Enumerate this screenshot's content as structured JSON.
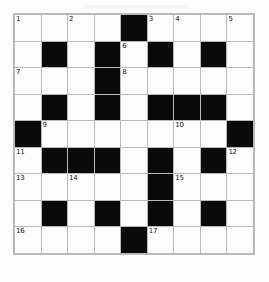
{
  "puzzle": {
    "title": "Crossword Grid",
    "rows": 9,
    "cols": 9,
    "colors": {
      "block": "#0a0a0a",
      "open": "#fcfcfc",
      "gridline": "#b9b9b9",
      "number": "#111111",
      "background": "#fdfdfd"
    },
    "grid": [
      [
        "open",
        "open",
        "open",
        "open",
        "block",
        "open",
        "open",
        "open",
        "open"
      ],
      [
        "open",
        "block",
        "open",
        "block",
        "open",
        "block",
        "open",
        "block",
        "open"
      ],
      [
        "open",
        "open",
        "open",
        "block",
        "open",
        "open",
        "open",
        "open",
        "open"
      ],
      [
        "open",
        "block",
        "open",
        "block",
        "open",
        "block",
        "block",
        "block",
        "open"
      ],
      [
        "block",
        "open",
        "open",
        "open",
        "open",
        "open",
        "open",
        "open",
        "block"
      ],
      [
        "open",
        "block",
        "block",
        "block",
        "open",
        "block",
        "open",
        "block",
        "open"
      ],
      [
        "open",
        "open",
        "open",
        "open",
        "open",
        "block",
        "open",
        "open",
        "open"
      ],
      [
        "open",
        "block",
        "open",
        "block",
        "open",
        "block",
        "open",
        "block",
        "open"
      ],
      [
        "open",
        "open",
        "open",
        "open",
        "block",
        "open",
        "open",
        "open",
        "open"
      ]
    ],
    "numbers": [
      {
        "row": 0,
        "col": 0,
        "label": "1"
      },
      {
        "row": 0,
        "col": 2,
        "label": "2"
      },
      {
        "row": 0,
        "col": 5,
        "label": "3"
      },
      {
        "row": 0,
        "col": 6,
        "label": "4"
      },
      {
        "row": 0,
        "col": 8,
        "label": "5"
      },
      {
        "row": 1,
        "col": 4,
        "label": "6"
      },
      {
        "row": 2,
        "col": 0,
        "label": "7"
      },
      {
        "row": 2,
        "col": 4,
        "label": "8"
      },
      {
        "row": 4,
        "col": 1,
        "label": "9"
      },
      {
        "row": 4,
        "col": 6,
        "label": "10"
      },
      {
        "row": 5,
        "col": 0,
        "label": "11"
      },
      {
        "row": 5,
        "col": 8,
        "label": "12"
      },
      {
        "row": 6,
        "col": 0,
        "label": "13"
      },
      {
        "row": 6,
        "col": 2,
        "label": "14"
      },
      {
        "row": 6,
        "col": 6,
        "label": "15"
      },
      {
        "row": 8,
        "col": 0,
        "label": "16"
      },
      {
        "row": 8,
        "col": 5,
        "label": "17"
      }
    ],
    "entries": []
  }
}
